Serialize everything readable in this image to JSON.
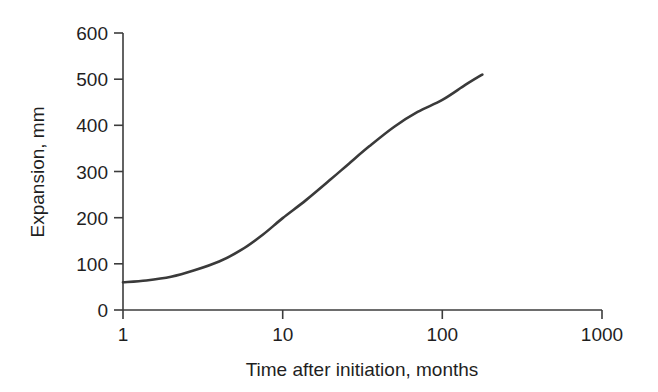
{
  "chart_data": {
    "type": "line",
    "title": "",
    "subtitle": "",
    "xlabel": "Time after initiation, months",
    "ylabel": "Expansion, mm",
    "xscale": "log",
    "yscale": "linear",
    "xlim": [
      1,
      1000
    ],
    "ylim": [
      0,
      600
    ],
    "xticks": [
      1,
      10,
      100,
      1000
    ],
    "xtick_labels": [
      "1",
      "10",
      "100",
      "1000"
    ],
    "yticks": [
      0,
      100,
      200,
      300,
      400,
      500,
      600
    ],
    "ytick_labels": [
      "0",
      "100",
      "200",
      "300",
      "400",
      "500",
      "600"
    ],
    "grid": false,
    "legend": false,
    "legend_position": "none",
    "line_color": "#3a3a3a",
    "series": [
      {
        "name": "Expansion",
        "x": [
          1,
          1.4,
          2,
          2.8,
          4,
          5.5,
          7.5,
          10,
          14,
          20,
          26,
          35,
          50,
          70,
          100,
          140,
          178
        ],
        "y": [
          60,
          64,
          72,
          86,
          105,
          130,
          163,
          199,
          238,
          283,
          317,
          355,
          397,
          429,
          455,
          488,
          510
        ]
      }
    ]
  },
  "axes": {
    "x_label": "Time after initiation, months",
    "y_label": "Expansion, mm"
  }
}
